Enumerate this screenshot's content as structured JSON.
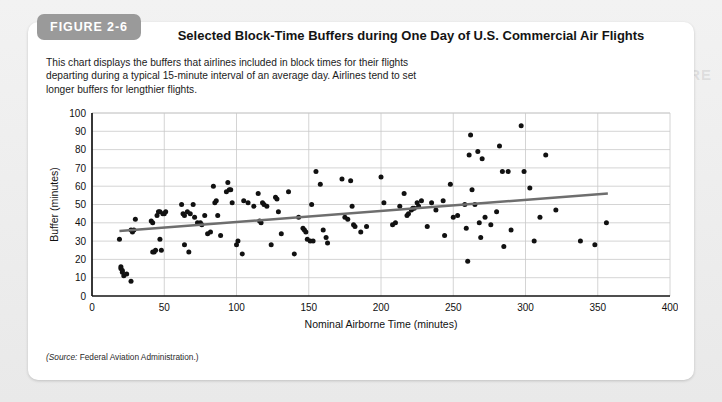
{
  "figure": {
    "tag": "FIGURE 2-6",
    "title": "Selected Block-Time Buffers during One Day of U.S. Commercial Air Flights",
    "description": "This chart displays the buffers that airlines included in block times for their flights departing during a typical 15-minute interval of an average day. Airlines tend to set longer buffers for lengthier flights.",
    "source_label": "(Source:",
    "source_text": "Federal Aviation Administration.)"
  },
  "background_text": {
    "heading": "YOU ARE THERE"
  },
  "colors": {
    "tag_background": "#9a9a9a",
    "tag_text": "#ffffff",
    "card_background": "#ffffff",
    "page_background": "#ededed",
    "point": "#111111",
    "trendline": "#6e6e6e",
    "gridline": "#c9c9c9",
    "axis": "#141414",
    "title_text": "#141414"
  },
  "chart_data": {
    "type": "scatter",
    "title": "Selected Block-Time Buffers during One Day of U.S. Commercial Air Flights",
    "xlabel": "Nominal Airborne Time (minutes)",
    "ylabel": "Buffer (minutes)",
    "xlim": [
      0,
      400
    ],
    "ylim": [
      0,
      100
    ],
    "xticks": [
      0,
      50,
      100,
      150,
      200,
      250,
      300,
      350,
      400
    ],
    "yticks": [
      0,
      10,
      20,
      30,
      40,
      50,
      60,
      70,
      80,
      90,
      100
    ],
    "grid": true,
    "legend": "none",
    "series": [
      {
        "name": "Flights",
        "marker": "circle",
        "points": [
          [
            19,
            31
          ],
          [
            20,
            16
          ],
          [
            20,
            15
          ],
          [
            21,
            14
          ],
          [
            21,
            13
          ],
          [
            22,
            11
          ],
          [
            24,
            12
          ],
          [
            27,
            8
          ],
          [
            27,
            36
          ],
          [
            28,
            35
          ],
          [
            29,
            36
          ],
          [
            30,
            42
          ],
          [
            41,
            41
          ],
          [
            42,
            40
          ],
          [
            42,
            24
          ],
          [
            43,
            24
          ],
          [
            44,
            25
          ],
          [
            45,
            44
          ],
          [
            46,
            46
          ],
          [
            47,
            46
          ],
          [
            47,
            31
          ],
          [
            48,
            25
          ],
          [
            49,
            45
          ],
          [
            50,
            45
          ],
          [
            51,
            46
          ],
          [
            62,
            50
          ],
          [
            63,
            45
          ],
          [
            64,
            44
          ],
          [
            64,
            28
          ],
          [
            66,
            46
          ],
          [
            67,
            24
          ],
          [
            68,
            45
          ],
          [
            70,
            50
          ],
          [
            71,
            43
          ],
          [
            73,
            40
          ],
          [
            75,
            40
          ],
          [
            76,
            39
          ],
          [
            78,
            44
          ],
          [
            80,
            34
          ],
          [
            82,
            35
          ],
          [
            84,
            60
          ],
          [
            85,
            51
          ],
          [
            86,
            52
          ],
          [
            87,
            44
          ],
          [
            89,
            33
          ],
          [
            93,
            57
          ],
          [
            94,
            62
          ],
          [
            95,
            58
          ],
          [
            96,
            58
          ],
          [
            97,
            51
          ],
          [
            100,
            28
          ],
          [
            101,
            30
          ],
          [
            104,
            23
          ],
          [
            105,
            52
          ],
          [
            108,
            51
          ],
          [
            112,
            49
          ],
          [
            115,
            56
          ],
          [
            116,
            41
          ],
          [
            117,
            40
          ],
          [
            118,
            51
          ],
          [
            119,
            50
          ],
          [
            121,
            49
          ],
          [
            124,
            28
          ],
          [
            127,
            54
          ],
          [
            128,
            53
          ],
          [
            129,
            46
          ],
          [
            131,
            34
          ],
          [
            136,
            57
          ],
          [
            140,
            23
          ],
          [
            143,
            43
          ],
          [
            146,
            37
          ],
          [
            147,
            36
          ],
          [
            148,
            35
          ],
          [
            149,
            31
          ],
          [
            151,
            30
          ],
          [
            152,
            50
          ],
          [
            153,
            30
          ],
          [
            155,
            68
          ],
          [
            158,
            61
          ],
          [
            160,
            36
          ],
          [
            162,
            32
          ],
          [
            163,
            29
          ],
          [
            173,
            64
          ],
          [
            175,
            43
          ],
          [
            177,
            42
          ],
          [
            179,
            63
          ],
          [
            180,
            49
          ],
          [
            181,
            39
          ],
          [
            182,
            38
          ],
          [
            186,
            35
          ],
          [
            190,
            38
          ],
          [
            200,
            65
          ],
          [
            202,
            51
          ],
          [
            208,
            39
          ],
          [
            210,
            40
          ],
          [
            213,
            49
          ],
          [
            216,
            56
          ],
          [
            218,
            44
          ],
          [
            219,
            45
          ],
          [
            221,
            47
          ],
          [
            222,
            48
          ],
          [
            223,
            48
          ],
          [
            225,
            51
          ],
          [
            226,
            49
          ],
          [
            228,
            52
          ],
          [
            232,
            38
          ],
          [
            235,
            51
          ],
          [
            238,
            47
          ],
          [
            243,
            52
          ],
          [
            244,
            33
          ],
          [
            248,
            61
          ],
          [
            250,
            43
          ],
          [
            253,
            44
          ],
          [
            258,
            50
          ],
          [
            259,
            37
          ],
          [
            260,
            19
          ],
          [
            261,
            77
          ],
          [
            262,
            88
          ],
          [
            263,
            58
          ],
          [
            265,
            50
          ],
          [
            267,
            79
          ],
          [
            268,
            40
          ],
          [
            269,
            32
          ],
          [
            270,
            75
          ],
          [
            272,
            43
          ],
          [
            276,
            39
          ],
          [
            280,
            46
          ],
          [
            282,
            82
          ],
          [
            284,
            68
          ],
          [
            285,
            27
          ],
          [
            288,
            68
          ],
          [
            290,
            36
          ],
          [
            297,
            93
          ],
          [
            299,
            68
          ],
          [
            303,
            59
          ],
          [
            306,
            30
          ],
          [
            310,
            43
          ],
          [
            314,
            77
          ],
          [
            321,
            47
          ],
          [
            338,
            30
          ],
          [
            348,
            28
          ],
          [
            356,
            40
          ]
        ]
      }
    ],
    "trendline": {
      "name": "Linear trend",
      "x_start": 19,
      "y_start": 35.5,
      "x_end": 357,
      "y_end": 56.0,
      "color": "#6e6e6e"
    }
  }
}
